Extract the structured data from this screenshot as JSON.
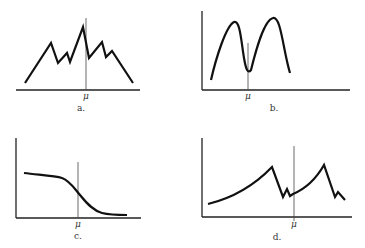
{
  "panels": [
    {
      "id": "a",
      "caption": "a.",
      "marker": "μ",
      "description": "multi-peaked jagged distribution with highest peak near mean"
    },
    {
      "id": "b",
      "caption": "b.",
      "marker": "μ",
      "description": "bimodal distribution with minimum at mean"
    },
    {
      "id": "c",
      "caption": "c.",
      "marker": "μ",
      "description": "decreasing sigmoid curve, steepest at mean"
    },
    {
      "id": "d",
      "caption": "d.",
      "marker": "μ",
      "description": "two rising convex segments each ending in sharp drop with small spike"
    }
  ],
  "colors": {
    "line": "#111111",
    "axis": "#222222",
    "mean_line": "#444444",
    "background": "#ffffff"
  }
}
